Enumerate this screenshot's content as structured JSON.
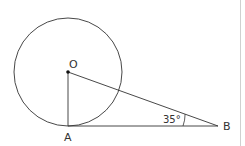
{
  "diagram": {
    "points": {
      "O": {
        "label": "O",
        "x": 68,
        "y": 72
      },
      "A": {
        "label": "A",
        "x": 68,
        "y": 126
      },
      "B": {
        "label": "B",
        "x": 218,
        "y": 126
      }
    },
    "circle": {
      "center": "O",
      "radius": 54
    },
    "segments": [
      [
        "O",
        "A"
      ],
      [
        "O",
        "B"
      ],
      [
        "A",
        "B"
      ]
    ],
    "angle": {
      "vertex": "B",
      "label": "35°"
    },
    "colors": {
      "stroke": "#333333",
      "border": "#d0d0d0",
      "background": "#ffffff"
    }
  }
}
